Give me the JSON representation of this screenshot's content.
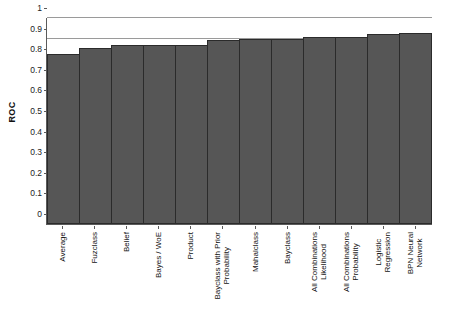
{
  "chart_data": {
    "type": "bar",
    "title": "",
    "xlabel": "",
    "ylabel": "ROC",
    "ylim": [
      0,
      1
    ],
    "ytick_labels": [
      "1",
      "0.9",
      "0.8",
      "0.7",
      "0.6",
      "0.5",
      "0.4",
      "0.3",
      "0.2",
      "0.1",
      "0"
    ],
    "ytick_values": [
      1,
      0.9,
      0.8,
      0.7,
      0.6,
      0.5,
      0.4,
      0.3,
      0.2,
      0.1,
      0
    ],
    "gridlines": [
      1,
      0.9
    ],
    "grid": true,
    "legend": null,
    "bar_color": "#565656",
    "bar_border_color": "#2b2b2b",
    "gridline_color": "#9a9a9a",
    "axis_color": "#5a5a5a",
    "categories": [
      "Average",
      "Fuzclass",
      "Belief",
      "Bayes / WoE",
      "Product",
      "Bayclass with Prior Probability",
      "Mahalclass",
      "Bayclass",
      "All Combinations Likelihood",
      "All Combinations Probability",
      "Logistic Regression",
      "BPN Neural Network"
    ],
    "category_lines": [
      [
        "Average",
        ""
      ],
      [
        "Fuzclass",
        ""
      ],
      [
        "Belief",
        ""
      ],
      [
        "Bayes / WoE",
        ""
      ],
      [
        "Product",
        ""
      ],
      [
        "Bayclass with Prior",
        "Probability"
      ],
      [
        "Mahalclass",
        ""
      ],
      [
        "Bayclass",
        ""
      ],
      [
        "All Combinations",
        "Likelihood"
      ],
      [
        "All Combinations",
        "Probability"
      ],
      [
        "Logistic",
        "Regression"
      ],
      [
        "BPN Neural",
        "Network"
      ]
    ],
    "values": [
      0.825,
      0.855,
      0.868,
      0.868,
      0.868,
      0.895,
      0.897,
      0.9,
      0.907,
      0.91,
      0.92,
      0.925
    ]
  }
}
